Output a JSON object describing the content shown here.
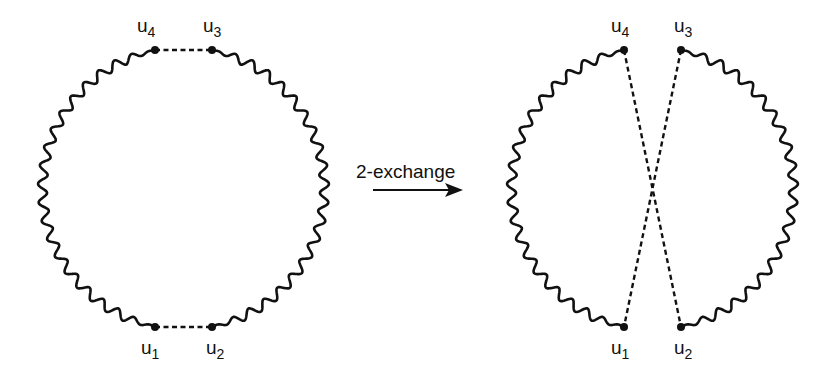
{
  "diagram": {
    "operation_label": "2-exchange",
    "colors": {
      "stroke": "#111111",
      "background": "#ffffff"
    },
    "before": {
      "nodes": [
        {
          "id": "u1",
          "name": "u",
          "sub": "1",
          "x": 155,
          "y": 327
        },
        {
          "id": "u2",
          "name": "u",
          "sub": "2",
          "x": 212,
          "y": 327
        },
        {
          "id": "u3",
          "name": "u",
          "sub": "3",
          "x": 212,
          "y": 50
        },
        {
          "id": "u4",
          "name": "u",
          "sub": "4",
          "x": 155,
          "y": 50
        }
      ],
      "dashed_edges": [
        [
          "u4",
          "u3"
        ],
        [
          "u1",
          "u2"
        ]
      ]
    },
    "after": {
      "nodes": [
        {
          "id": "u1",
          "name": "u",
          "sub": "1",
          "x": 624,
          "y": 327
        },
        {
          "id": "u2",
          "name": "u",
          "sub": "2",
          "x": 681,
          "y": 327
        },
        {
          "id": "u3",
          "name": "u",
          "sub": "3",
          "x": 681,
          "y": 50
        },
        {
          "id": "u4",
          "name": "u",
          "sub": "4",
          "x": 624,
          "y": 50
        }
      ],
      "dashed_edges": [
        [
          "u4",
          "u2"
        ],
        [
          "u3",
          "u1"
        ]
      ]
    }
  }
}
